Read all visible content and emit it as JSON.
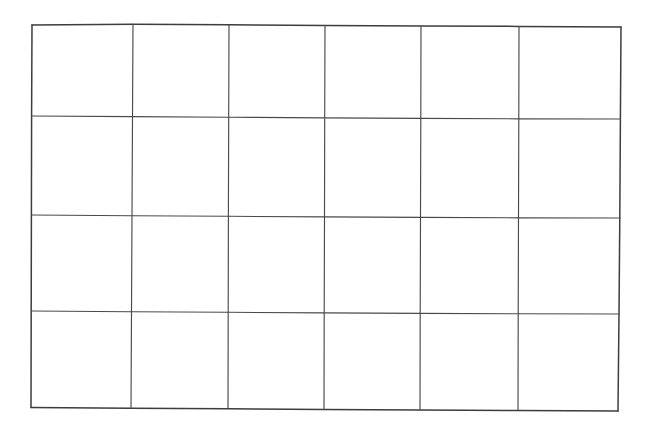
{
  "document": {
    "kind": "hand-drawn-grid",
    "title": "Hand-drawn grid table",
    "background_color": "#ffffff",
    "ink_color": "#4a4a4a",
    "outer_ink_color": "#3d3d3d",
    "stroke_width_px": 1.2,
    "canvas": {
      "width": 647,
      "height": 432
    }
  },
  "grid": {
    "columns": 6,
    "rows": 4,
    "cell_count": 24,
    "has_text": false,
    "has_shading": false,
    "notes": "Empty hand-ruled grid; no labels, numbers or marks inside any cell.",
    "bounds": {
      "top_left": [
        32,
        25
      ],
      "top_right": [
        621,
        27
      ],
      "bottom_right": [
        618,
        411
      ],
      "bottom_left": [
        31,
        408
      ]
    },
    "vertical_line_x_top": [
      32,
      133,
      229,
      325,
      421,
      519,
      621
    ],
    "vertical_line_x_bottom": [
      31,
      131,
      228,
      324,
      420,
      518,
      618
    ],
    "horizontal_line_y_left": [
      25,
      116,
      215,
      311,
      408
    ],
    "horizontal_line_y_right": [
      27,
      119,
      218,
      314,
      411
    ],
    "column_widths_px": [
      101,
      96,
      96,
      96,
      98,
      102
    ],
    "row_heights_px": [
      91,
      99,
      96,
      97
    ]
  },
  "paths": {
    "outer_top": "M 32 25 L 133 24.2 L 229 24.8 L 325 25.4 L 421 26 L 519 26.4 L 621 27",
    "outer_bottom": "M 31 407.6 L 131 408.2 L 228 408.8 L 324 409.4 L 420 410 L 518 410.5 L 618 411",
    "outer_left": "M 32 25 L 31.6 116 L 31.4 215 L 31.2 311 L 31 407.6",
    "outer_right": "M 621 27 L 620.4 119 L 619.8 218 L 619 314 L 618 411",
    "horizontals": [
      "M 31.6 116 L 131.6 116.6 L 228.2 117.2 L 324.4 117.9 L 420.4 118.4 L 518.4 118.8 L 620.4 119",
      "M 31.4 215 L 131.3 215.7 L 228.1 216.3 L 324.2 216.9 L 420.2 217.4 L 518.2 217.8 L 619.8 218",
      "M 31.2 311 L 131.1 311.7 L 228 312.3 L 324.1 312.9 L 420.1 313.4 L 518.1 313.8 L 619 314"
    ],
    "verticals": [
      "M 133 24.2 L 132.5 116.6 L 132 215.7 L 131.5 311.7 L 131 408.2",
      "M 229 24.8 L 228.7 117.2 L 228.4 216.3 L 228.2 312.3 L 228 408.8",
      "M 325 25.4 L 324.7 117.9 L 324.5 216.9 L 324.2 312.9 L 324 409.4",
      "M 421 26 L 420.8 118.4 L 420.5 217.4 L 420.2 313.4 L 420 410",
      "M 519 26.4 L 518.8 118.8 L 518.5 217.8 L 518.2 313.8 L 518 410.5"
    ]
  },
  "cells": [
    {
      "row": 1,
      "col": 1,
      "text": ""
    },
    {
      "row": 1,
      "col": 2,
      "text": ""
    },
    {
      "row": 1,
      "col": 3,
      "text": ""
    },
    {
      "row": 1,
      "col": 4,
      "text": ""
    },
    {
      "row": 1,
      "col": 5,
      "text": ""
    },
    {
      "row": 1,
      "col": 6,
      "text": ""
    },
    {
      "row": 2,
      "col": 1,
      "text": ""
    },
    {
      "row": 2,
      "col": 2,
      "text": ""
    },
    {
      "row": 2,
      "col": 3,
      "text": ""
    },
    {
      "row": 2,
      "col": 4,
      "text": ""
    },
    {
      "row": 2,
      "col": 5,
      "text": ""
    },
    {
      "row": 2,
      "col": 6,
      "text": ""
    },
    {
      "row": 3,
      "col": 1,
      "text": ""
    },
    {
      "row": 3,
      "col": 2,
      "text": ""
    },
    {
      "row": 3,
      "col": 3,
      "text": ""
    },
    {
      "row": 3,
      "col": 4,
      "text": ""
    },
    {
      "row": 3,
      "col": 5,
      "text": ""
    },
    {
      "row": 3,
      "col": 6,
      "text": ""
    },
    {
      "row": 4,
      "col": 1,
      "text": ""
    },
    {
      "row": 4,
      "col": 2,
      "text": ""
    },
    {
      "row": 4,
      "col": 3,
      "text": ""
    },
    {
      "row": 4,
      "col": 4,
      "text": ""
    },
    {
      "row": 4,
      "col": 5,
      "text": ""
    },
    {
      "row": 4,
      "col": 6,
      "text": ""
    }
  ]
}
